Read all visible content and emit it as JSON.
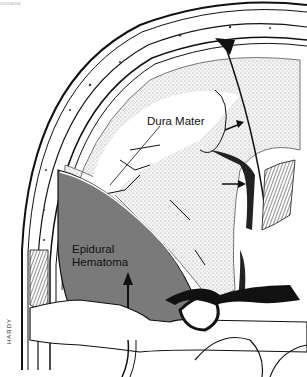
{
  "figure": {
    "caption_fragment": "ocesarea",
    "labels": {
      "dura_mater": "Dura Mater",
      "epidural_line1": "Epidural",
      "epidural_line2": "Hematoma"
    },
    "signature": "HARDY",
    "colors": {
      "hematoma": "#7a7a7a",
      "ink": "#111111",
      "brain_stipple": "#d9d9d9",
      "background": "#ffffff"
    }
  }
}
